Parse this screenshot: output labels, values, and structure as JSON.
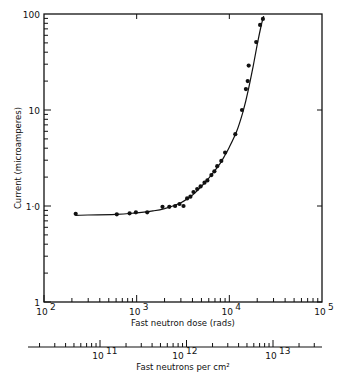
{
  "chart_data": {
    "type": "scatter",
    "title": "",
    "xlabel": "Fast neutron dose (rads)",
    "ylabel": "Current (microamperes)",
    "secondary_xlabel": "Fast neutrons per cm²",
    "xscale": "log",
    "yscale": "log",
    "xlim": [
      100,
      100000
    ],
    "ylim": [
      0.1,
      100
    ],
    "grid": false,
    "legend": null,
    "x_ticks": [
      {
        "value": 100,
        "label": "10",
        "exp": "2"
      },
      {
        "value": 1000,
        "label": "10",
        "exp": "3"
      },
      {
        "value": 10000,
        "label": "10",
        "exp": "4"
      },
      {
        "value": 100000,
        "label": "10",
        "exp": "5"
      }
    ],
    "y_ticks": [
      {
        "value": 100,
        "label": "100"
      },
      {
        "value": 10,
        "label": "10"
      },
      {
        "value": 1,
        "label": "1·0"
      },
      {
        "value": 0.1,
        "label": "1"
      }
    ],
    "secondary_x_ticks": [
      {
        "label": "10",
        "exp": "11",
        "px": 100
      },
      {
        "label": "10",
        "exp": "12",
        "px": 180
      },
      {
        "label": "10",
        "exp": "13",
        "px": 273
      }
    ],
    "series": [
      {
        "name": "measured",
        "style": "points",
        "x": [
          220,
          610,
          840,
          980,
          1300,
          1900,
          2250,
          2600,
          2900,
          3200,
          3500,
          3800,
          4100,
          4500,
          4900,
          5400,
          5800,
          6400,
          6900,
          7400,
          8200,
          9000,
          11600,
          13700,
          15100,
          15800,
          16200,
          19500,
          21500,
          23000
        ],
        "y": [
          0.83,
          0.82,
          0.84,
          0.86,
          0.86,
          0.98,
          0.98,
          1.0,
          1.05,
          1.0,
          1.2,
          1.25,
          1.4,
          1.5,
          1.6,
          1.75,
          1.85,
          2.1,
          2.3,
          2.6,
          2.95,
          3.6,
          5.6,
          10,
          16.5,
          20,
          29,
          51,
          77,
          89
        ]
      },
      {
        "name": "fitted curve",
        "style": "line",
        "x": [
          220,
          600,
          1000,
          1500,
          2000,
          3000,
          4000,
          5000,
          6000,
          7000,
          8000,
          9000,
          10000,
          12000,
          14000,
          16000,
          18000,
          20000,
          22000,
          23500
        ],
        "y": [
          0.8,
          0.82,
          0.85,
          0.89,
          0.94,
          1.08,
          1.3,
          1.6,
          1.95,
          2.35,
          2.8,
          3.4,
          4.1,
          6.0,
          9.5,
          16,
          28,
          48,
          75,
          95
        ]
      }
    ]
  }
}
